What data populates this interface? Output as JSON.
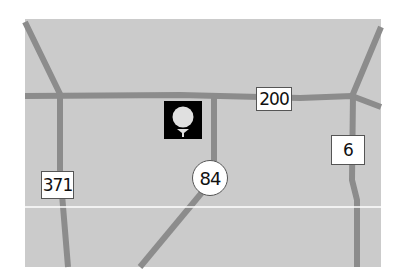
{
  "map": {
    "background": "#cbcbcb",
    "road_color": "#8c8c8c",
    "route_markers": [
      {
        "label": "200",
        "shape": "square"
      },
      {
        "label": "6",
        "shape": "square"
      },
      {
        "label": "371",
        "shape": "square"
      },
      {
        "label": "84",
        "shape": "circle"
      }
    ],
    "poi": {
      "icon": "golf-ball-on-tee-icon"
    }
  }
}
